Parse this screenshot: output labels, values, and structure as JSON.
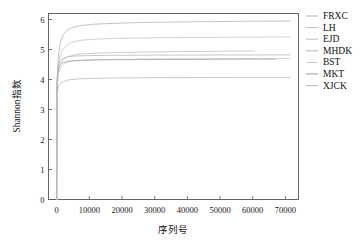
{
  "chart_data": {
    "type": "line",
    "title": "",
    "xlabel": "序列号",
    "ylabel": "Shannon指数",
    "xlim": [
      -2500,
      74000
    ],
    "ylim": [
      0,
      6.2
    ],
    "grid": false,
    "legend_position": "right",
    "xticks": [
      0,
      10000,
      20000,
      30000,
      40000,
      50000,
      60000,
      70000
    ],
    "xtick_labels": [
      "0",
      "10000",
      "20000",
      "30000",
      "40000",
      "50000",
      "60000",
      "70000"
    ],
    "yticks": [
      0,
      1,
      2,
      3,
      4,
      5,
      6
    ],
    "ytick_labels": [
      "0",
      "1",
      "2",
      "3",
      "4",
      "5",
      "6"
    ],
    "series": [
      {
        "name": "FRXC",
        "color": "#b9b9bd",
        "plateau": 5.95,
        "x_end": 71500,
        "x": [
          0,
          120,
          300,
          600,
          1100,
          2000,
          3200,
          5000,
          7500,
          11000,
          15000,
          20000,
          26000,
          33000,
          40000,
          48000,
          56000,
          64000,
          71500
        ],
        "y": [
          0.0,
          3.62,
          4.35,
          4.86,
          5.22,
          5.49,
          5.64,
          5.74,
          5.8,
          5.84,
          5.86,
          5.88,
          5.9,
          5.91,
          5.92,
          5.93,
          5.94,
          5.945,
          5.95
        ]
      },
      {
        "name": "LH",
        "color": "#c9c9cd",
        "plateau": 5.42,
        "x_end": 71500,
        "x": [
          0,
          120,
          300,
          600,
          1100,
          2000,
          3200,
          5000,
          7500,
          11000,
          15000,
          20000,
          26000,
          33000,
          40000,
          48000,
          56000,
          64000,
          71500
        ],
        "y": [
          0.0,
          3.55,
          4.18,
          4.55,
          4.82,
          5.03,
          5.16,
          5.25,
          5.31,
          5.34,
          5.36,
          5.375,
          5.385,
          5.395,
          5.4,
          5.405,
          5.41,
          5.415,
          5.42
        ]
      },
      {
        "name": "EJD",
        "color": "#c4c4c8",
        "plateau": 4.95,
        "x_end": 60500,
        "x": [
          0,
          120,
          300,
          600,
          1100,
          2000,
          3200,
          5000,
          7500,
          11000,
          15000,
          20000,
          26000,
          33000,
          40000,
          48000,
          54000,
          60500
        ],
        "y": [
          0.0,
          3.5,
          4.02,
          4.32,
          4.52,
          4.66,
          4.75,
          4.81,
          4.85,
          4.875,
          4.89,
          4.9,
          4.915,
          4.925,
          4.935,
          4.94,
          4.945,
          4.95
        ]
      },
      {
        "name": "MHDK",
        "color": "#bdbdc1",
        "plateau": 4.82,
        "x_end": 71500,
        "x": [
          0,
          120,
          300,
          600,
          1100,
          2000,
          3200,
          5000,
          7500,
          11000,
          15000,
          20000,
          26000,
          33000,
          40000,
          48000,
          56000,
          64000,
          71500
        ],
        "y": [
          0.0,
          3.88,
          4.28,
          4.5,
          4.63,
          4.71,
          4.755,
          4.78,
          4.79,
          4.8,
          4.805,
          4.808,
          4.81,
          4.812,
          4.814,
          4.816,
          4.818,
          4.819,
          4.82
        ]
      },
      {
        "name": "BST",
        "color": "#cfcfd3",
        "plateau": 4.7,
        "x_end": 71500,
        "x": [
          0,
          120,
          300,
          600,
          1100,
          2000,
          3200,
          5000,
          7500,
          11000,
          15000,
          20000,
          26000,
          33000,
          40000,
          48000,
          56000,
          64000,
          71500
        ],
        "y": [
          0.0,
          3.45,
          3.95,
          4.2,
          4.38,
          4.5,
          4.575,
          4.62,
          4.645,
          4.66,
          4.67,
          4.675,
          4.682,
          4.687,
          4.69,
          4.693,
          4.696,
          4.698,
          4.7
        ]
      },
      {
        "name": "MKT",
        "color": "#a8a8ac",
        "plateau": 4.68,
        "x_end": 67000,
        "x": [
          0,
          120,
          300,
          600,
          1100,
          2000,
          3200,
          5000,
          7500,
          11000,
          15000,
          20000,
          26000,
          33000,
          40000,
          48000,
          56000,
          62000,
          67000
        ],
        "y": [
          0.0,
          3.9,
          4.22,
          4.4,
          4.5,
          4.565,
          4.6,
          4.625,
          4.64,
          4.648,
          4.655,
          4.66,
          4.665,
          4.668,
          4.671,
          4.674,
          4.677,
          4.679,
          4.68
        ]
      },
      {
        "name": "XJCK",
        "color": "#c0c0c4",
        "plateau": 4.07,
        "x_end": 71500,
        "x": [
          0,
          120,
          300,
          600,
          1100,
          2000,
          3200,
          5000,
          7500,
          11000,
          15000,
          20000,
          26000,
          33000,
          40000,
          48000,
          56000,
          64000,
          71500
        ],
        "y": [
          0.0,
          3.35,
          3.62,
          3.76,
          3.86,
          3.93,
          3.975,
          4.005,
          4.025,
          4.038,
          4.046,
          4.052,
          4.058,
          4.062,
          4.065,
          4.067,
          4.069,
          4.0695,
          4.07
        ]
      }
    ]
  },
  "legend": {
    "items": [
      {
        "label": "FRXC"
      },
      {
        "label": "LH"
      },
      {
        "label": "EJD"
      },
      {
        "label": "MHDK"
      },
      {
        "label": "BST"
      },
      {
        "label": "MKT"
      },
      {
        "label": "XJCK"
      }
    ]
  }
}
